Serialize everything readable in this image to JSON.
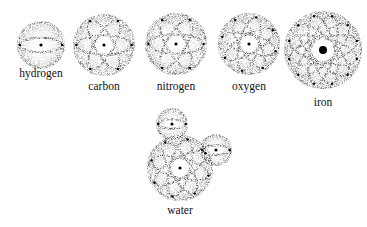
{
  "figure": {
    "colors": {
      "ink": "#222222",
      "background": "#ffffff"
    },
    "atoms": [
      {
        "id": "hydrogen",
        "label": "hydrogen",
        "cx": 41,
        "cy": 45,
        "r": 23,
        "orbits": 1,
        "label_x": 41,
        "label_y": 67
      },
      {
        "id": "carbon",
        "label": "carbon",
        "cx": 104,
        "cy": 45,
        "r": 30,
        "orbits": 3,
        "label_x": 104,
        "label_y": 80
      },
      {
        "id": "nitrogen",
        "label": "nitrogen",
        "cx": 176,
        "cy": 44,
        "r": 30,
        "orbits": 3,
        "label_x": 176,
        "label_y": 80
      },
      {
        "id": "oxygen",
        "label": "oxygen",
        "cx": 249,
        "cy": 44,
        "r": 30,
        "orbits": 4,
        "label_x": 249,
        "label_y": 80
      },
      {
        "id": "iron",
        "label": "iron",
        "cx": 323,
        "cy": 50,
        "r": 38,
        "orbits": 6,
        "label_x": 323,
        "label_y": 96
      }
    ],
    "molecule": {
      "id": "water",
      "label": "water",
      "label_x": 180,
      "label_y": 204,
      "core": {
        "cx": 180,
        "cy": 168,
        "r": 32,
        "orbits": 4
      },
      "hydrogens": [
        {
          "cx": 172,
          "cy": 124,
          "r": 15
        },
        {
          "cx": 216,
          "cy": 150,
          "r": 15
        }
      ]
    }
  }
}
